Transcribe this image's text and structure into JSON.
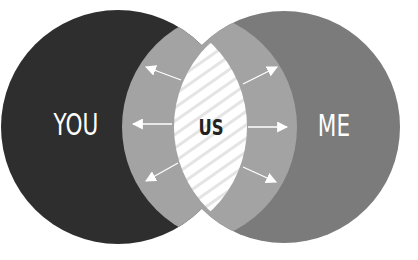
{
  "diagram": {
    "type": "venn",
    "labels": {
      "left": "YOU",
      "right": "ME",
      "intersection": "US"
    },
    "colors": {
      "background": "#ffffff",
      "left_circle": "#2e2e2e",
      "right_circle": "#7b7b7b",
      "overlap_band": "#a3a3a3",
      "intersection_fill": "#ffffff",
      "intersection_hatch": "#e6e6e6",
      "left_label": "#ffffff",
      "right_label": "#ffffff",
      "intersection_label": "#222222",
      "arrows": "#ffffff"
    },
    "arrows": [
      {
        "name": "arrow-upper-left",
        "from": [
          181,
          80
        ],
        "to": [
          145,
          66
        ]
      },
      {
        "name": "arrow-middle-left",
        "from": [
          172,
          124
        ],
        "to": [
          132,
          124
        ]
      },
      {
        "name": "arrow-lower-left",
        "from": [
          178,
          163
        ],
        "to": [
          145,
          182
        ]
      },
      {
        "name": "arrow-upper-right",
        "from": [
          243,
          84
        ],
        "to": [
          278,
          66
        ]
      },
      {
        "name": "arrow-middle-right",
        "from": [
          248,
          127
        ],
        "to": [
          288,
          127
        ]
      },
      {
        "name": "arrow-lower-right",
        "from": [
          243,
          167
        ],
        "to": [
          277,
          183
        ]
      }
    ]
  }
}
